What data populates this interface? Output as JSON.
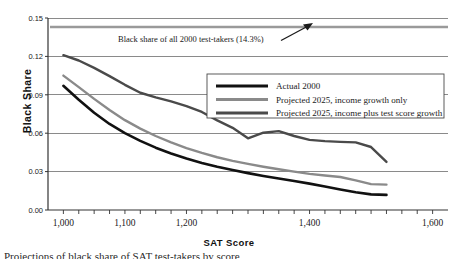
{
  "chart_data": {
    "type": "line",
    "title": "",
    "xlabel": "SAT Score",
    "ylabel": "Black Share",
    "xlim": [
      975,
      1625
    ],
    "ylim": [
      0,
      0.15
    ],
    "grid": true,
    "x_ticks_major": [
      1000,
      1100,
      1200,
      1400,
      1600
    ],
    "x_tick_labels": [
      "1,000",
      "1,100",
      "1,200",
      "1,400",
      "1,600"
    ],
    "y_ticks": [
      0,
      0.03,
      0.06,
      0.09,
      0.12,
      0.15
    ],
    "y_tick_labels": [
      "0.00",
      "0.03",
      "0.06",
      "0.09",
      "0.12",
      "0.15"
    ],
    "x": [
      1000,
      1025,
      1050,
      1075,
      1100,
      1125,
      1150,
      1175,
      1200,
      1225,
      1250,
      1275,
      1300,
      1325,
      1350,
      1375,
      1400,
      1425,
      1450,
      1475,
      1500,
      1525
    ],
    "series": [
      {
        "name": "Actual 2000",
        "color": "#111111",
        "width": 2.6,
        "values": [
          0.097,
          0.0862,
          0.076,
          0.0672,
          0.06,
          0.054,
          0.0487,
          0.0442,
          0.0402,
          0.0368,
          0.0338,
          0.0312,
          0.0288,
          0.0266,
          0.0246,
          0.0226,
          0.0206,
          0.0184,
          0.016,
          0.0138,
          0.0122,
          0.0118
        ]
      },
      {
        "name": "Projected 2025, income growth only",
        "color": "#8a8a8a",
        "width": 2.4,
        "values": [
          0.105,
          0.096,
          0.0868,
          0.0782,
          0.0702,
          0.0636,
          0.0578,
          0.0528,
          0.0484,
          0.0446,
          0.0412,
          0.0384,
          0.036,
          0.0338,
          0.0318,
          0.03,
          0.0282,
          0.027,
          0.0258,
          0.0232,
          0.0202,
          0.0198
        ]
      },
      {
        "name": "Projected 2025, income plus test score growth",
        "color": "#4a4a4a",
        "width": 2.4,
        "values": [
          0.121,
          0.1168,
          0.111,
          0.1046,
          0.0978,
          0.0916,
          0.088,
          0.0848,
          0.0812,
          0.0766,
          0.07,
          0.0642,
          0.056,
          0.0604,
          0.0616,
          0.0578,
          0.0548,
          0.0538,
          0.0532,
          0.0528,
          0.0492,
          0.0376
        ]
      }
    ],
    "reference_line": {
      "name": "black-share-all-test-takers",
      "value": 0.143,
      "color": "#9a9a9a",
      "width": 2.4
    },
    "annotation": {
      "text": "Black share of all 2000 test-takers (14.3%)",
      "has_arrow": true
    },
    "legend": {
      "position": "center-right",
      "entries": [
        "Actual 2000",
        "Projected 2025, income growth only",
        "Projected 2025, income plus test score growth"
      ]
    }
  },
  "figure": {
    "axis_title_y": "Black Share",
    "axis_title_x": "SAT Score",
    "caption": "Projections of black share of SAT test-takers by score"
  }
}
